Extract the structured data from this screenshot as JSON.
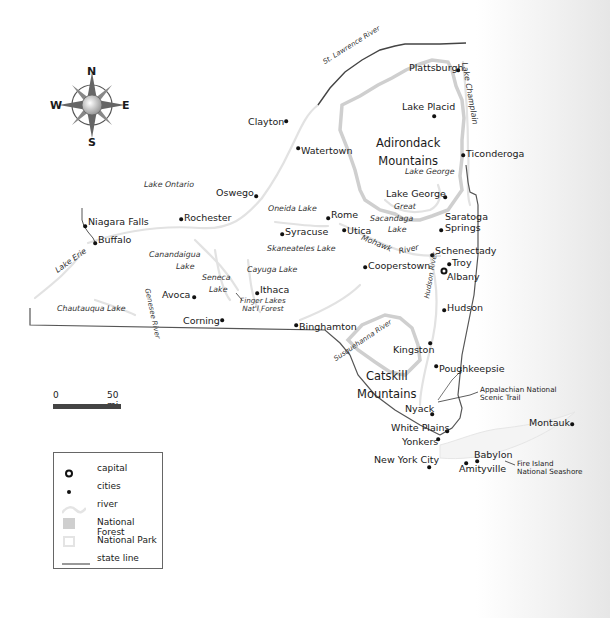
{
  "map": {
    "title": "New York State",
    "compass": {
      "n": "N",
      "s": "S",
      "e": "E",
      "w": "W"
    },
    "mountains": [
      {
        "name": "Adirondack\nMountains",
        "line1": "Adirondack",
        "line2": "Mountains"
      },
      {
        "name": "Catskill\nMountains",
        "line1": "Catskill",
        "line2": "Mountains"
      }
    ],
    "cities": [
      {
        "name": "Plattsburgh"
      },
      {
        "name": "Lake Placid"
      },
      {
        "name": "Clayton"
      },
      {
        "name": "Watertown"
      },
      {
        "name": "Ticonderoga"
      },
      {
        "name": "Oswego"
      },
      {
        "name": "Lake George"
      },
      {
        "name": "Rochester"
      },
      {
        "name": "Niagara Falls"
      },
      {
        "name": "Buffalo"
      },
      {
        "name": "Rome"
      },
      {
        "name": "Syracuse"
      },
      {
        "name": "Utica"
      },
      {
        "name": "Saratoga"
      },
      {
        "name": "Springs"
      },
      {
        "name": "Schenectady"
      },
      {
        "name": "Troy"
      },
      {
        "name": "Albany"
      },
      {
        "name": "Cooperstown"
      },
      {
        "name": "Ithaca"
      },
      {
        "name": "Avoca"
      },
      {
        "name": "Corning"
      },
      {
        "name": "Binghamton"
      },
      {
        "name": "Hudson"
      },
      {
        "name": "Kingston"
      },
      {
        "name": "Poughkeepsie"
      },
      {
        "name": "Nyack"
      },
      {
        "name": "White Plains"
      },
      {
        "name": "Yonkers"
      },
      {
        "name": "New York City"
      },
      {
        "name": "Babylon"
      },
      {
        "name": "Amityville"
      },
      {
        "name": "Montauk"
      }
    ],
    "water": {
      "st_lawrence": "St. Lawrence River",
      "lake_champlain": "Lake Champlain",
      "lake_george": "Lake George",
      "lake_ontario": "Lake Ontario",
      "oneida": "Oneida Lake",
      "great": "Great",
      "sacandaga": "Sacandaga",
      "lake": "Lake",
      "mohawk": "Mohawk",
      "river": "River",
      "skaneateles": "Skaneateles Lake",
      "canandaigua": "Canandaigua",
      "seneca": "Seneca",
      "cayuga": "Cayuga Lake",
      "lake_erie": "Lake Erie",
      "chautauqua": "Chautauqua Lake",
      "genesee": "Genesee River",
      "susquehanna": "Susquehanna River",
      "hudson_river": "Hudson River"
    },
    "parks": {
      "finger_lakes_1": "Finger Lakes",
      "finger_lakes_2": "Nat'l Forest",
      "appalachian_1": "Appalachian National",
      "appalachian_2": "Scenic Trail",
      "fire_island_1": "Fire Island",
      "fire_island_2": "National Seashore"
    },
    "scale": {
      "start": "0",
      "end": "50 mi"
    },
    "legend": {
      "items": [
        {
          "symbol": "capital",
          "label": "capital"
        },
        {
          "symbol": "city",
          "label": "cities"
        },
        {
          "symbol": "river",
          "label": "river"
        },
        {
          "symbol": "national-forest",
          "label": "National Forest"
        },
        {
          "symbol": "national-park",
          "label": "National Park"
        },
        {
          "symbol": "state-line",
          "label": "state line"
        }
      ]
    },
    "colors": {
      "state_line": "#555555",
      "river": "#e6e6e6",
      "national_forest": "#cfcfcf",
      "national_park": "#e4e4e4",
      "scale_bar": "#444444"
    }
  }
}
